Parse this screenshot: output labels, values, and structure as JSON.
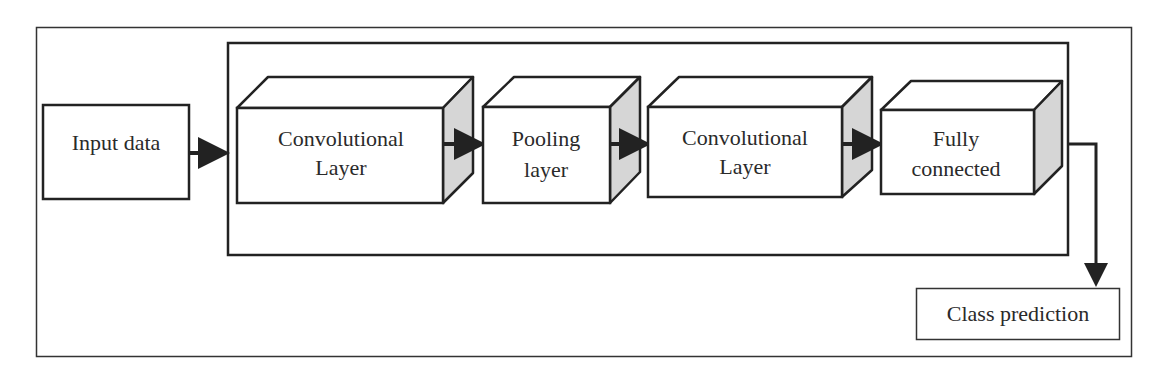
{
  "diagram": {
    "colors": {
      "stroke": "#222222",
      "side_face": "#d6d6d6",
      "background": "#ffffff"
    },
    "nodes": {
      "input": {
        "label": "Input data"
      },
      "conv1": {
        "line1": "Convolutional",
        "line2": "Layer"
      },
      "pool": {
        "line1": "Pooling",
        "line2": "layer"
      },
      "conv2": {
        "line1": "Convolutional",
        "line2": "Layer"
      },
      "fc": {
        "line1": "Fully",
        "line2": "connected"
      },
      "output": {
        "label": "Class prediction"
      }
    },
    "edges": [
      {
        "from": "input",
        "to": "conv1"
      },
      {
        "from": "conv1",
        "to": "pool"
      },
      {
        "from": "pool",
        "to": "conv2"
      },
      {
        "from": "conv2",
        "to": "fc"
      },
      {
        "from": "fc",
        "to": "output"
      }
    ]
  }
}
